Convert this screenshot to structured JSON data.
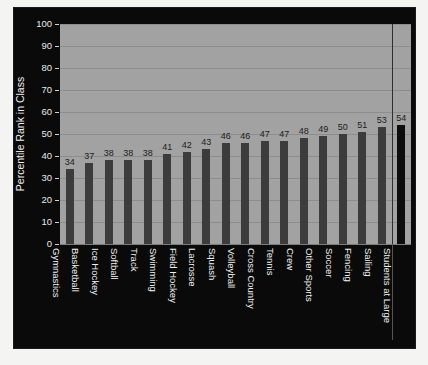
{
  "chart_data": {
    "type": "bar",
    "title": "",
    "xlabel": "",
    "ylabel": "Percentile Rank in Class",
    "ylim": [
      0,
      100
    ],
    "ytick_step": 10,
    "yticks": [
      0,
      10,
      20,
      30,
      40,
      50,
      60,
      70,
      80,
      90,
      100
    ],
    "grid": true,
    "legend": "none",
    "categories": [
      "Gymnastics",
      "Basketball",
      "Ice Hockey",
      "Softball",
      "Track",
      "Swimming",
      "Field Hockey",
      "Lacrosse",
      "Squash",
      "Volleyball",
      "Cross Country",
      "Tennis",
      "Crew",
      "Other Sports",
      "Soccer",
      "Fencing",
      "Sailing",
      "Students at Large"
    ],
    "values": [
      34,
      37,
      38,
      38,
      38,
      41,
      42,
      43,
      46,
      46,
      47,
      47,
      48,
      49,
      50,
      51,
      53,
      54
    ],
    "value_labels": [
      "34",
      "37",
      "38",
      "38",
      "38",
      "41",
      "42",
      "43",
      "46",
      "46",
      "47",
      "47",
      "48",
      "49",
      "50",
      "51",
      "53",
      "54"
    ],
    "highlight_index": 17,
    "divider_before_index": 17,
    "colors": {
      "bar": "#3c3c3c",
      "bar_highlight": "#0d0d0d",
      "plot_background": "#a2a2a2",
      "figure_background": "#0a0a0a",
      "gridline": "#8d8d8d",
      "axis_text": "#efefef",
      "value_text": "#1c1c1c",
      "page_background": "#f4f4f2"
    }
  }
}
